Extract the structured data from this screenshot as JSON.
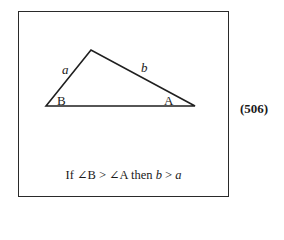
{
  "figure": {
    "triangle": {
      "vertices": {
        "B": [
          46,
          106
        ],
        "C": [
          91,
          50
        ],
        "A": [
          195,
          106
        ]
      },
      "side_labels": {
        "a": "a",
        "b": "b"
      },
      "angle_labels": {
        "B": "B",
        "A": "A"
      }
    },
    "caption": {
      "prefix": "If ∠B > ∠A then ",
      "b": "b",
      "mid": " > ",
      "a": "a"
    },
    "equation_number": "(506)"
  }
}
